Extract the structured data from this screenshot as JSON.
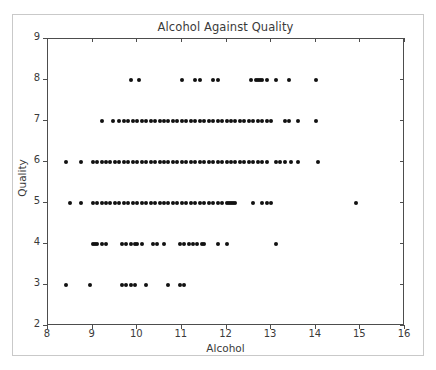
{
  "chart_data": {
    "type": "scatter",
    "title": "Alcohol Against Quality",
    "xlabel": "Alcohol",
    "ylabel": "Quality",
    "xlim": [
      8,
      16
    ],
    "ylim": [
      2,
      9
    ],
    "xticks": [
      8,
      9,
      10,
      11,
      12,
      13,
      14,
      15,
      16
    ],
    "yticks": [
      2,
      3,
      4,
      5,
      6,
      7,
      8,
      9
    ],
    "grid": false,
    "legend": null,
    "marker": {
      "shape": "circle",
      "color": "#111111",
      "size_px": 4
    },
    "series": [
      {
        "name": "wine samples",
        "points_by_quality": [
          {
            "quality": 3,
            "x": [
              8.4,
              8.95,
              9.65,
              9.75,
              9.85,
              9.95,
              10.2,
              10.7,
              10.95,
              11.05
            ]
          },
          {
            "quality": 4,
            "x": [
              9.0,
              9.05,
              9.1,
              9.2,
              9.3,
              9.65,
              9.75,
              9.85,
              9.95,
              10.0,
              10.1,
              10.35,
              10.45,
              10.6,
              10.95,
              11.05,
              11.15,
              11.25,
              11.35,
              11.45,
              11.5,
              11.8,
              12.0,
              13.1
            ]
          },
          {
            "quality": 5,
            "x": [
              8.5,
              8.75,
              9.0,
              9.1,
              9.2,
              9.3,
              9.4,
              9.5,
              9.6,
              9.7,
              9.8,
              9.9,
              10.0,
              10.1,
              10.2,
              10.3,
              10.4,
              10.5,
              10.6,
              10.7,
              10.8,
              10.9,
              11.0,
              11.1,
              11.2,
              11.3,
              11.4,
              11.5,
              11.6,
              11.7,
              11.8,
              11.9,
              12.0,
              12.05,
              12.1,
              12.15,
              12.2,
              12.6,
              12.8,
              12.9,
              13.0,
              14.9
            ]
          },
          {
            "quality": 6,
            "x": [
              8.4,
              8.75,
              9.0,
              9.1,
              9.2,
              9.3,
              9.4,
              9.5,
              9.6,
              9.7,
              9.8,
              9.9,
              10.0,
              10.1,
              10.2,
              10.3,
              10.4,
              10.5,
              10.6,
              10.7,
              10.8,
              10.9,
              11.0,
              11.1,
              11.2,
              11.3,
              11.4,
              11.5,
              11.6,
              11.7,
              11.8,
              11.9,
              12.0,
              12.1,
              12.2,
              12.3,
              12.4,
              12.5,
              12.6,
              12.7,
              12.8,
              12.9,
              13.1,
              13.2,
              13.3,
              13.45,
              13.6,
              14.05
            ]
          },
          {
            "quality": 7,
            "x": [
              9.2,
              9.45,
              9.6,
              9.7,
              9.8,
              9.9,
              10.0,
              10.1,
              10.2,
              10.3,
              10.4,
              10.5,
              10.6,
              10.7,
              10.8,
              10.9,
              11.0,
              11.1,
              11.2,
              11.3,
              11.4,
              11.5,
              11.6,
              11.7,
              11.8,
              11.9,
              12.0,
              12.1,
              12.2,
              12.3,
              12.4,
              12.5,
              12.6,
              12.7,
              12.8,
              12.9,
              13.0,
              13.3,
              13.4,
              13.6,
              14.0
            ]
          },
          {
            "quality": 8,
            "x": [
              9.85,
              10.05,
              11.0,
              11.3,
              11.4,
              11.7,
              11.8,
              12.55,
              12.65,
              12.7,
              12.75,
              12.8,
              12.9,
              13.1,
              13.4,
              14.0
            ]
          }
        ]
      }
    ]
  }
}
